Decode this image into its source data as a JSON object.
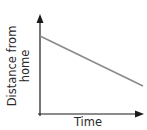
{
  "chart_data": {
    "type": "line",
    "title": "",
    "xlabel": "Time",
    "ylabel": "Distance from home",
    "ylabel_lines": [
      "Distance from",
      "home"
    ],
    "x": [
      0,
      1
    ],
    "series": [
      {
        "name": "distance",
        "values": [
          0.78,
          0.28
        ],
        "color": "#8a8a8a"
      }
    ],
    "ylim": [
      0,
      1
    ],
    "xlim": [
      0,
      1
    ],
    "grid": false,
    "legend": "none",
    "ticks": "none",
    "axis_color": "#1a1a1a",
    "annotations": []
  }
}
